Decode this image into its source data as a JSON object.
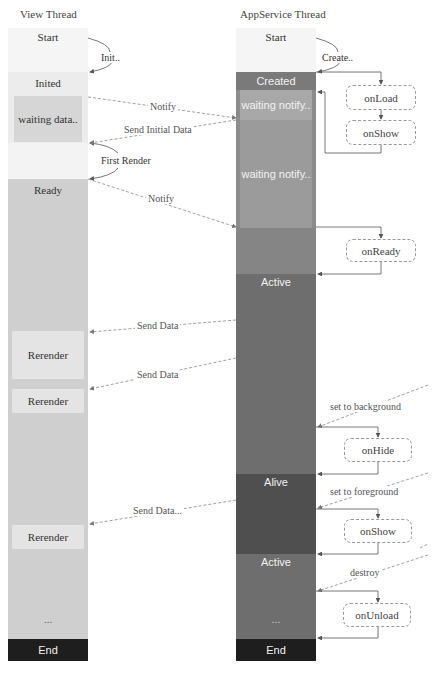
{
  "view_thread": {
    "title": "View Thread",
    "states": {
      "start": "Start",
      "inited": "Inited",
      "waiting_data": "waiting data..",
      "ready": "Ready",
      "rerender_1": "Rerender",
      "rerender_2": "Rerender",
      "rerender_3": "Rerender",
      "ellipsis": "...",
      "end": "End"
    }
  },
  "appservice_thread": {
    "title": "AppService Thread",
    "states": {
      "start": "Start",
      "created": "Created",
      "waiting_notify_1": "waiting notify..",
      "waiting_notify_2": "waiting notify..",
      "active_1": "Active",
      "alive": "Alive",
      "active_2": "Active",
      "ellipsis": "...",
      "end": "End"
    }
  },
  "lifecycle_hooks": {
    "on_load": "onLoad",
    "on_show_1": "onShow",
    "on_ready": "onReady",
    "on_hide": "onHide",
    "on_show_2": "onShow",
    "on_unload": "onUnload"
  },
  "transitions": {
    "init": "Init..",
    "create": "Create..",
    "first_render": "First Render"
  },
  "messages": {
    "notify_1": "Notify",
    "send_initial_data": "Send Initial Data",
    "notify_2": "Notify",
    "send_data_1": "Send Data",
    "send_data_2": "Send Data",
    "send_data_3": "Send Data...",
    "set_to_background": "set to background",
    "set_to_foreground": "set to foreground",
    "destroy": "destroy"
  },
  "colors": {
    "view_light": "#f4f4f4",
    "view_inited": "#ececec",
    "view_waiting": "#d6d6d6",
    "view_ready": "#cfcfcf",
    "view_rerender": "#e4e4e4",
    "view_end": "#1e1e1e",
    "app_created": "#7a7a7a",
    "app_waiting_1": "#a3a3a3",
    "app_waiting_2": "#999999",
    "app_phase": "#8a8a8a",
    "app_active": "#6e6e6e",
    "app_alive": "#4f4f4f",
    "app_end": "#1e1e1e"
  }
}
